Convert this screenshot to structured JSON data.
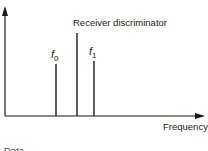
{
  "diagram": {
    "title_label": "Receiver discriminator",
    "x_axis_label": "Frequency",
    "y_axis_label": "",
    "markers": [
      {
        "symbol": "f",
        "subscript": "0",
        "x": 56,
        "top": 64
      },
      {
        "symbol": "f",
        "subscript": "1",
        "x": 94,
        "top": 61
      }
    ],
    "discriminator_line": {
      "x": 77,
      "top": 33
    },
    "cut_off_text": "Data",
    "colors": {
      "ink": "#1a1a1a",
      "background": "#ffffff"
    }
  }
}
